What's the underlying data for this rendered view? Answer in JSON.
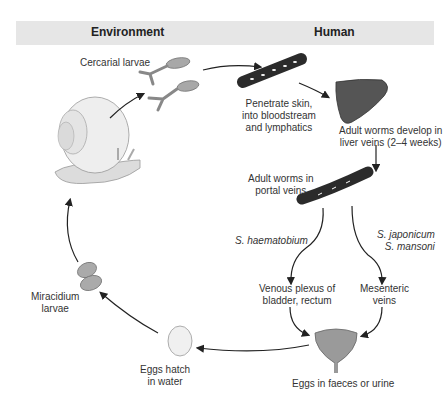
{
  "header": {
    "environment": "Environment",
    "human": "Human"
  },
  "labels": {
    "cercarial": "Cercarial larvae",
    "penetrate_1": "Penetrate skin,",
    "penetrate_2": "into bloodstream",
    "penetrate_3": "and lymphatics",
    "liver_1": "Adult worms develop in",
    "liver_2": "liver veins (2–4 weeks)",
    "portal_1": "Adult worms in",
    "portal_2": "portal veins",
    "haematobium": "S. haematobium",
    "japonicum": "S. japonicum",
    "mansoni": "S. mansoni",
    "venous_1": "Venous plexus of",
    "venous_2": "bladder, rectum",
    "mesenteric_1": "Mesenteric",
    "mesenteric_2": "veins",
    "eggs_excreted": "Eggs in faeces or urine",
    "hatch_1": "Eggs hatch",
    "hatch_2": "in water",
    "miracidium_1": "Miracidium",
    "miracidium_2": "larvae"
  },
  "colors": {
    "header_bg": "#e6e6e6",
    "vessel": "#2b2b2b",
    "liver": "#555555",
    "larva": "#a8a8a8",
    "snail": "#e8e8e8",
    "arrow": "#222222"
  }
}
